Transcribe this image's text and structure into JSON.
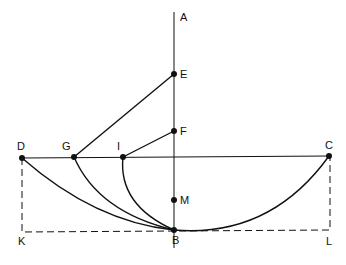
{
  "diagram": {
    "type": "geometric construction (curves of descent)",
    "points": {
      "A": {
        "label": "A",
        "x": 174,
        "y": 12
      },
      "E": {
        "label": "E",
        "x": 174,
        "y": 74
      },
      "F": {
        "label": "F",
        "x": 174,
        "y": 131
      },
      "M": {
        "label": "M",
        "x": 174,
        "y": 200
      },
      "B": {
        "label": "B",
        "x": 174,
        "y": 230
      },
      "D": {
        "label": "D",
        "x": 22,
        "y": 158
      },
      "G": {
        "label": "G",
        "x": 74,
        "y": 157
      },
      "I": {
        "label": "I",
        "x": 123,
        "y": 157
      },
      "C": {
        "label": "C",
        "x": 329,
        "y": 156
      },
      "K": {
        "label": "K",
        "x": 22,
        "y": 232
      },
      "L": {
        "label": "L",
        "x": 330,
        "y": 230
      }
    },
    "segments": [
      "A-B",
      "D-C",
      "E-G",
      "F-I"
    ],
    "curves": [
      "D-B",
      "G-B",
      "I-B",
      "B-C"
    ],
    "dashed": [
      "D-K",
      "K-L",
      "L-C"
    ]
  }
}
